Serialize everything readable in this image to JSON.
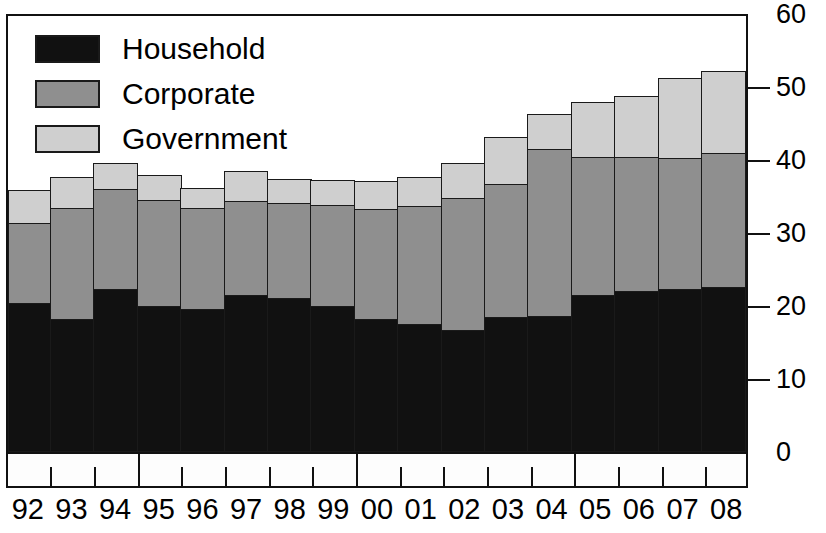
{
  "chart_data": {
    "type": "bar",
    "subtype": "stacked-bar",
    "title": "",
    "xlabel": "",
    "ylabel": "",
    "ylim": [
      0,
      60
    ],
    "yticks": [
      0,
      10,
      20,
      30,
      40,
      50,
      60
    ],
    "grid": false,
    "legend_position": "top-left",
    "categories": [
      "92",
      "93",
      "94",
      "95",
      "96",
      "97",
      "98",
      "99",
      "00",
      "01",
      "02",
      "03",
      "04",
      "05",
      "06",
      "07",
      "08"
    ],
    "series": [
      {
        "name": "Household",
        "color": "#111111",
        "values": [
          20.4,
          18.2,
          22.2,
          20.0,
          19.5,
          21.4,
          21.0,
          20.0,
          18.1,
          17.4,
          16.7,
          18.4,
          18.5,
          21.5,
          22.0,
          22.3,
          22.6
        ]
      },
      {
        "name": "Corporate",
        "color": "#8f8f8f",
        "values": [
          11.1,
          15.4,
          13.9,
          14.7,
          14.0,
          13.1,
          13.2,
          14.0,
          15.3,
          16.5,
          18.2,
          18.4,
          23.2,
          19.1,
          18.6,
          18.1,
          18.5
        ]
      },
      {
        "name": "Government",
        "color": "#cfcfcf",
        "values": [
          4.7,
          4.4,
          3.9,
          3.6,
          3.0,
          4.3,
          3.6,
          3.6,
          4.1,
          4.1,
          5.1,
          6.7,
          5.0,
          7.7,
          8.5,
          11.2,
          11.4
        ]
      }
    ],
    "totals": [
      36.2,
      38.0,
      40.0,
      38.3,
      36.5,
      38.8,
      37.8,
      37.6,
      37.5,
      38.0,
      40.0,
      43.5,
      46.7,
      48.3,
      49.1,
      51.6,
      52.5
    ]
  },
  "legend": {
    "items": [
      {
        "label": "Household",
        "swatch": "household"
      },
      {
        "label": "Corporate",
        "swatch": "corporate"
      },
      {
        "label": "Government",
        "swatch": "government"
      }
    ]
  },
  "y_axis": {
    "ticks": [
      {
        "label": "60",
        "value": 60
      },
      {
        "label": "50",
        "value": 50
      },
      {
        "label": "40",
        "value": 40
      },
      {
        "label": "30",
        "value": 30
      },
      {
        "label": "20",
        "value": 20
      },
      {
        "label": "10",
        "value": 10
      },
      {
        "label": "0",
        "value": 0
      }
    ]
  },
  "x_axis": {
    "labels": [
      "92",
      "93",
      "94",
      "95",
      "96",
      "97",
      "98",
      "99",
      "00",
      "01",
      "02",
      "03",
      "04",
      "05",
      "06",
      "07",
      "08"
    ],
    "major_tick_indices": [
      2,
      7,
      12
    ]
  }
}
